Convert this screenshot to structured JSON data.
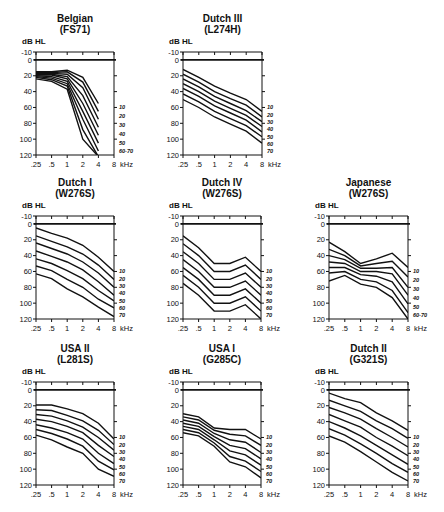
{
  "figure": {
    "y_axis_label": "dB HL",
    "x_unit_label": "kHz",
    "x_ticks": [
      ".25",
      ".5",
      "1",
      "2",
      "4",
      "8"
    ],
    "y_ticks": [
      "-10",
      "0",
      "20",
      "40",
      "60",
      "80",
      "100",
      "120"
    ]
  },
  "chart_data": [
    {
      "type": "line",
      "title": "Belgian",
      "subtitle": "(FS71)",
      "xlabel": "kHz",
      "ylabel": "dB HL",
      "x": [
        0.25,
        0.5,
        1,
        2,
        4,
        8
      ],
      "ylim": [
        120,
        -10
      ],
      "right_labels": [
        "10",
        "20",
        "30",
        "40",
        "50",
        "60-70"
      ],
      "series": [
        {
          "name": "1",
          "values": [
            15,
            15,
            13,
            22,
            55,
            null
          ]
        },
        {
          "name": "2",
          "values": [
            16,
            16,
            15,
            28,
            65,
            null
          ]
        },
        {
          "name": "3",
          "values": [
            17,
            17,
            18,
            35,
            75,
            null
          ]
        },
        {
          "name": "4",
          "values": [
            18,
            18,
            21,
            45,
            85,
            null
          ]
        },
        {
          "name": "5",
          "values": [
            19,
            19,
            24,
            55,
            95,
            null
          ]
        },
        {
          "name": "6",
          "values": [
            20,
            21,
            27,
            65,
            105,
            null
          ]
        },
        {
          "name": "7",
          "values": [
            21,
            23,
            30,
            75,
            115,
            null
          ]
        },
        {
          "name": "8",
          "values": [
            22,
            25,
            33,
            88,
            122,
            null
          ]
        },
        {
          "name": "9",
          "values": [
            24,
            27,
            37,
            100,
            122,
            null
          ]
        }
      ]
    },
    {
      "type": "line",
      "title": "Dutch III",
      "subtitle": "(L274H)",
      "xlabel": "kHz",
      "ylabel": "dB HL",
      "x": [
        0.25,
        0.5,
        1,
        2,
        4,
        8
      ],
      "ylim": [
        120,
        -10
      ],
      "right_labels": [
        "10",
        "20",
        "30",
        "40",
        "50",
        "60",
        "70"
      ],
      "series": [
        {
          "name": "10",
          "values": [
            12,
            22,
            33,
            42,
            50,
            65
          ]
        },
        {
          "name": "20",
          "values": [
            18,
            28,
            40,
            49,
            57,
            72
          ]
        },
        {
          "name": "30",
          "values": [
            24,
            34,
            46,
            55,
            64,
            78
          ]
        },
        {
          "name": "40",
          "values": [
            30,
            40,
            52,
            61,
            70,
            84
          ]
        },
        {
          "name": "50",
          "values": [
            36,
            46,
            58,
            67,
            76,
            91
          ]
        },
        {
          "name": "60",
          "values": [
            43,
            53,
            65,
            74,
            83,
            97
          ]
        },
        {
          "name": "70",
          "values": [
            50,
            60,
            72,
            81,
            90,
            105
          ]
        }
      ]
    },
    {
      "type": "line",
      "title": "Dutch I",
      "subtitle": "(W276S)",
      "xlabel": "kHz",
      "ylabel": "dB HL",
      "x": [
        0.25,
        0.5,
        1,
        2,
        4,
        8
      ],
      "ylim": [
        120,
        -10
      ],
      "right_labels": [
        "10",
        "20",
        "30",
        "40",
        "50",
        "60",
        "70"
      ],
      "series": [
        {
          "name": "10",
          "values": [
            5,
            12,
            18,
            27,
            42,
            60
          ]
        },
        {
          "name": "20",
          "values": [
            15,
            22,
            29,
            38,
            52,
            70
          ]
        },
        {
          "name": "30",
          "values": [
            24,
            31,
            38,
            48,
            62,
            80
          ]
        },
        {
          "name": "40",
          "values": [
            34,
            41,
            48,
            58,
            73,
            90
          ]
        },
        {
          "name": "50",
          "values": [
            44,
            50,
            59,
            69,
            84,
            97
          ]
        },
        {
          "name": "60",
          "values": [
            53,
            59,
            70,
            80,
            95,
            106
          ]
        },
        {
          "name": "70",
          "values": [
            63,
            69,
            82,
            92,
            105,
            117
          ]
        }
      ]
    },
    {
      "type": "line",
      "title": "Dutch IV",
      "subtitle": "(W276S)",
      "xlabel": "kHz",
      "ylabel": "dB HL",
      "x": [
        0.25,
        0.5,
        1,
        2,
        4,
        8
      ],
      "ylim": [
        120,
        -10
      ],
      "right_labels": [
        "10",
        "20",
        "30",
        "40",
        "50",
        "60",
        "70"
      ],
      "series": [
        {
          "name": "10",
          "values": [
            15,
            30,
            50,
            50,
            42,
            60
          ]
        },
        {
          "name": "20",
          "values": [
            25,
            40,
            60,
            60,
            52,
            70
          ]
        },
        {
          "name": "30",
          "values": [
            35,
            50,
            70,
            70,
            62,
            80
          ]
        },
        {
          "name": "40",
          "values": [
            45,
            60,
            80,
            80,
            72,
            90
          ]
        },
        {
          "name": "50",
          "values": [
            55,
            70,
            90,
            90,
            82,
            100
          ]
        },
        {
          "name": "60",
          "values": [
            65,
            80,
            100,
            100,
            92,
            110
          ]
        },
        {
          "name": "70",
          "values": [
            75,
            90,
            110,
            110,
            102,
            120
          ]
        }
      ]
    },
    {
      "type": "line",
      "title": "Japanese",
      "subtitle": "(W276S)",
      "xlabel": "kHz",
      "ylabel": "dB HL",
      "x": [
        0.25,
        0.5,
        1,
        2,
        4,
        8
      ],
      "ylim": [
        120,
        -10
      ],
      "right_labels": [
        "10",
        "20",
        "30",
        "40",
        "50",
        "60-70"
      ],
      "series": [
        {
          "name": "10",
          "values": [
            23,
            35,
            50,
            44,
            37,
            55
          ]
        },
        {
          "name": "20",
          "values": [
            32,
            40,
            53,
            50,
            47,
            67
          ]
        },
        {
          "name": "30",
          "values": [
            40,
            45,
            56,
            56,
            55,
            80
          ]
        },
        {
          "name": "40",
          "values": [
            48,
            50,
            60,
            60,
            63,
            90
          ]
        },
        {
          "name": "50",
          "values": [
            55,
            55,
            64,
            66,
            73,
            101
          ]
        },
        {
          "name": "60",
          "values": [
            62,
            60,
            70,
            73,
            84,
            112
          ]
        },
        {
          "name": "70",
          "values": [
            72,
            65,
            76,
            80,
            93,
            120
          ]
        }
      ]
    },
    {
      "type": "line",
      "title": "USA II",
      "subtitle": "(L281S)",
      "xlabel": "kHz",
      "ylabel": "dB HL",
      "x": [
        0.25,
        0.5,
        1,
        2,
        4,
        8
      ],
      "ylim": [
        120,
        -10
      ],
      "right_labels": [
        "10",
        "20",
        "30",
        "40",
        "50",
        "60",
        "70"
      ],
      "series": [
        {
          "name": "10",
          "values": [
            19,
            19,
            24,
            30,
            42,
            62
          ]
        },
        {
          "name": "20",
          "values": [
            25,
            26,
            32,
            39,
            51,
            69
          ]
        },
        {
          "name": "30",
          "values": [
            31,
            33,
            39,
            47,
            60,
            76
          ]
        },
        {
          "name": "40",
          "values": [
            37,
            40,
            46,
            54,
            70,
            84
          ]
        },
        {
          "name": "50",
          "values": [
            44,
            48,
            54,
            62,
            80,
            93
          ]
        },
        {
          "name": "60",
          "values": [
            50,
            55,
            62,
            71,
            90,
            101
          ]
        },
        {
          "name": "70",
          "values": [
            57,
            63,
            72,
            80,
            100,
            109
          ]
        }
      ]
    },
    {
      "type": "line",
      "title": "USA I",
      "subtitle": "(G285C)",
      "xlabel": "kHz",
      "ylabel": "dB HL",
      "x": [
        0.25,
        0.5,
        1,
        2,
        4,
        8
      ],
      "ylim": [
        120,
        -10
      ],
      "right_labels": [
        "10",
        "20",
        "30",
        "40",
        "50",
        "60",
        "70"
      ],
      "series": [
        {
          "name": "10",
          "values": [
            30,
            34,
            48,
            50,
            50,
            62
          ]
        },
        {
          "name": "20",
          "values": [
            34,
            38,
            51,
            56,
            58,
            70
          ]
        },
        {
          "name": "30",
          "values": [
            38,
            42,
            55,
            63,
            66,
            79
          ]
        },
        {
          "name": "40",
          "values": [
            42,
            46,
            59,
            70,
            74,
            87
          ]
        },
        {
          "name": "50",
          "values": [
            46,
            50,
            63,
            77,
            82,
            95
          ]
        },
        {
          "name": "60",
          "values": [
            50,
            54,
            67,
            84,
            90,
            103
          ]
        },
        {
          "name": "70",
          "values": [
            54,
            58,
            71,
            91,
            97,
            111
          ]
        }
      ]
    },
    {
      "type": "line",
      "title": "Dutch II",
      "subtitle": "(G321S)",
      "xlabel": "kHz",
      "ylabel": "dB HL",
      "x": [
        0.25,
        0.5,
        1,
        2,
        4,
        8
      ],
      "ylim": [
        120,
        -10
      ],
      "right_labels": [
        "10",
        "20",
        "30",
        "40",
        "50",
        "60",
        "70"
      ],
      "series": [
        {
          "name": "10",
          "values": [
            4,
            11,
            16,
            29,
            39,
            51
          ]
        },
        {
          "name": "20",
          "values": [
            13,
            20,
            27,
            39,
            49,
            61
          ]
        },
        {
          "name": "30",
          "values": [
            22,
            29,
            37,
            49,
            60,
            72
          ]
        },
        {
          "name": "40",
          "values": [
            31,
            39,
            47,
            60,
            71,
            83
          ]
        },
        {
          "name": "50",
          "values": [
            40,
            48,
            58,
            70,
            82,
            94
          ]
        },
        {
          "name": "60",
          "values": [
            49,
            57,
            68,
            80,
            93,
            104
          ]
        },
        {
          "name": "70",
          "values": [
            58,
            66,
            78,
            91,
            104,
            115
          ]
        }
      ]
    }
  ],
  "layout": {
    "panels": [
      {
        "left": 36,
        "right": 114,
        "ymin10": 52,
        "y120": 155
      },
      {
        "left": 183,
        "right": 262,
        "ymin10": 52,
        "y120": 155
      },
      {
        "left": 36,
        "right": 114,
        "ymin10": 216,
        "y120": 319
      },
      {
        "left": 183,
        "right": 261,
        "ymin10": 216,
        "y120": 319
      },
      {
        "left": 329,
        "right": 408,
        "ymin10": 216,
        "y120": 319
      },
      {
        "left": 36,
        "right": 114,
        "ymin10": 382,
        "y120": 485
      },
      {
        "left": 183,
        "right": 261,
        "ymin10": 382,
        "y120": 485
      },
      {
        "left": 329,
        "right": 408,
        "ymin10": 382,
        "y120": 485
      }
    ]
  }
}
